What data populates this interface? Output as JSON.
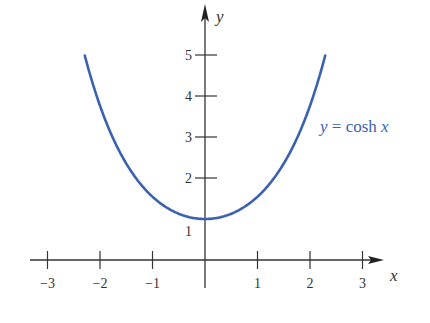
{
  "chart_data": {
    "type": "line",
    "title": "",
    "xlabel": "x",
    "ylabel": "y",
    "xlim": [
      -3.3,
      3.5
    ],
    "ylim": [
      0,
      5.5
    ],
    "x_ticks": [
      -3,
      -2,
      -1,
      1,
      2,
      3
    ],
    "x_tick_labels": [
      "−3",
      "−2",
      "−1",
      "1",
      "2",
      "3"
    ],
    "y_ticks": [
      1,
      2,
      3,
      4,
      5
    ],
    "y_tick_labels": [
      "1",
      "2",
      "3",
      "4",
      "5"
    ],
    "grid": false,
    "series": [
      {
        "name": "y = cosh x",
        "function": "cosh(x)",
        "color": "#3a62b0",
        "x": [
          -2.29,
          -2,
          -1.5,
          -1,
          -0.5,
          0,
          0.5,
          1,
          1.5,
          2,
          2.29
        ],
        "values": [
          5.0,
          3.76,
          2.35,
          1.54,
          1.13,
          1.0,
          1.13,
          1.54,
          2.35,
          3.76,
          5.0
        ]
      }
    ],
    "annotations": [
      {
        "text_prefix": "y",
        "text_mid": " = cosh ",
        "text_suffix": "x",
        "position": [
          2.2,
          3.0
        ]
      }
    ]
  }
}
